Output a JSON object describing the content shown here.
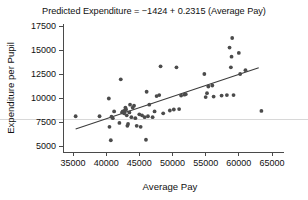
{
  "chart_data": {
    "type": "scatter",
    "title": "Predicted Expenditure = −1424 + 0.2315 (Average Pay)",
    "xlabel": "Average Pay",
    "ylabel": "Expenditure per Pupil",
    "xlim": [
      33500,
      66500
    ],
    "ylim": [
      4400,
      18000
    ],
    "xticks": [
      35000,
      40000,
      45000,
      50000,
      55000,
      60000,
      65000
    ],
    "yticks": [
      5000,
      7500,
      10000,
      12500,
      15000,
      17500
    ],
    "xtick_labels": [
      "35000",
      "40000",
      "45000",
      "50000",
      "55000",
      "60000",
      "65000"
    ],
    "ytick_labels": [
      "5000",
      "7500",
      "10000",
      "12500",
      "15000",
      "17500"
    ],
    "grid": "horizontal-single",
    "gridline_y": 7800,
    "legend": null,
    "marker_color": "#4b4b4b",
    "line_color": "#3c3c3c",
    "fit_line": {
      "intercept": -1424,
      "slope": 0.2315,
      "x_start": 35400,
      "x_end": 63000,
      "y_start": 6772,
      "y_end": 13160,
      "equation": "Predicted Expenditure = −1424 + 0.2315 (Average Pay)"
    },
    "x": [
      35400,
      39000,
      40400,
      40500,
      40700,
      40800,
      41000,
      41200,
      42000,
      42200,
      42400,
      42500,
      42700,
      42800,
      42900,
      43000,
      43100,
      43200,
      43300,
      43500,
      43600,
      43800,
      44000,
      44200,
      44400,
      44600,
      45000,
      45200,
      45400,
      45800,
      46000,
      46100,
      46300,
      46500,
      47000,
      47300,
      47600,
      48000,
      48200,
      48600,
      49600,
      50200,
      50600,
      51000,
      51300,
      51800,
      52000,
      54800,
      55000,
      55200,
      55400,
      56000,
      56200,
      57400,
      58200,
      58600,
      58800,
      58900,
      59000,
      59200,
      60000,
      60200,
      61000,
      63400
    ],
    "y": [
      8100,
      8100,
      9950,
      7000,
      5600,
      8050,
      7900,
      8600,
      7400,
      11950,
      8500,
      8600,
      8400,
      8700,
      9000,
      8800,
      8200,
      7100,
      7300,
      8500,
      9300,
      8000,
      9000,
      9200,
      7900,
      7100,
      8300,
      7000,
      8200,
      8000,
      5650,
      10650,
      8100,
      9300,
      8000,
      8600,
      10200,
      10300,
      13300,
      8400,
      8700,
      8800,
      13200,
      8850,
      10250,
      10350,
      10400,
      12500,
      10100,
      10500,
      11200,
      11300,
      10150,
      10250,
      10300,
      15250,
      13200,
      14300,
      16250,
      10300,
      14700,
      12500,
      12900,
      8650
    ]
  }
}
